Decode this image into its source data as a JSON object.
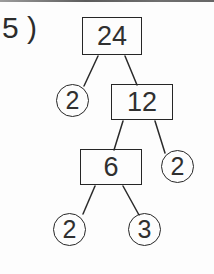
{
  "page": {
    "background": "#fdfdfd",
    "top_border_color": "#6f6f6f"
  },
  "problem": {
    "number_label": "5 )"
  },
  "factor_tree": {
    "title": "factor tree of 24",
    "root_value": "24",
    "prime_factors": [
      "2",
      "2",
      "2",
      "3"
    ],
    "colors": {
      "stroke": "#262626",
      "line": "#2a2a2a",
      "text": "#303030"
    },
    "nodes": [
      {
        "id": "24",
        "shape": "rect",
        "label": "24"
      },
      {
        "id": "2-left",
        "shape": "circle",
        "label": "2"
      },
      {
        "id": "12",
        "shape": "rect",
        "label": "12"
      },
      {
        "id": "6",
        "shape": "rect",
        "label": "6"
      },
      {
        "id": "2-right",
        "shape": "circle",
        "label": "2"
      },
      {
        "id": "2-bottom",
        "shape": "circle",
        "label": "2"
      },
      {
        "id": "3-bottom",
        "shape": "circle",
        "label": "3"
      }
    ],
    "edges": [
      {
        "from": "24",
        "to": "2-left"
      },
      {
        "from": "24",
        "to": "12"
      },
      {
        "from": "12",
        "to": "6"
      },
      {
        "from": "12",
        "to": "2-right"
      },
      {
        "from": "6",
        "to": "2-bottom"
      },
      {
        "from": "6",
        "to": "3-bottom"
      }
    ]
  }
}
